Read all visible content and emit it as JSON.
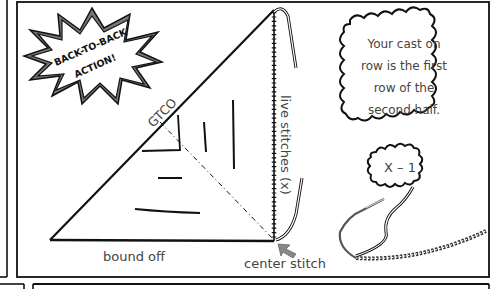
{
  "diagram": {
    "type": "knitting-instruction-comic-panel",
    "burst": {
      "line1": "BACK-TO-BACK",
      "line2": "ACTION!"
    },
    "triangle_labels": {
      "hypotenuse": "GTCO",
      "right_edge": "live stitches (x)",
      "bottom_edge": "bound off",
      "corner": "center stitch"
    },
    "callout": {
      "line1": "Your cast on",
      "line2": "row is the first",
      "line3": "row of the",
      "line4": "second half."
    },
    "needle_bubble": {
      "text": "X – 1"
    },
    "colors": {
      "ink": "#111111",
      "label": "#444444",
      "burst_shadow": "#777777",
      "arrow": "#888888",
      "paper": "#ffffff"
    }
  }
}
